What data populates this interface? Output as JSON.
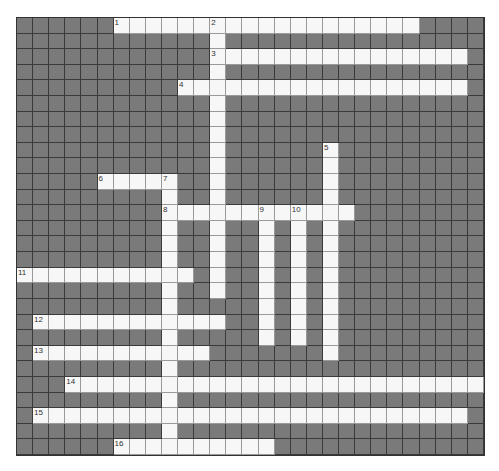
{
  "puzzle": {
    "cols": 29,
    "rows": 28,
    "colors": {
      "block": "#7a7a7a",
      "open": "#f7f7f7",
      "gridline": "#3a3a3a"
    },
    "across": [
      {
        "number": 1,
        "row": 0,
        "col": 6,
        "length": 19
      },
      {
        "number": 3,
        "row": 2,
        "col": 12,
        "length": 16
      },
      {
        "number": 4,
        "row": 4,
        "col": 10,
        "length": 18
      },
      {
        "number": 6,
        "row": 10,
        "col": 5,
        "length": 5
      },
      {
        "number": 8,
        "row": 12,
        "col": 9,
        "length": 12
      },
      {
        "number": 11,
        "row": 16,
        "col": 0,
        "length": 11
      },
      {
        "number": 12,
        "row": 19,
        "col": 1,
        "length": 12
      },
      {
        "number": 13,
        "row": 21,
        "col": 1,
        "length": 11
      },
      {
        "number": 14,
        "row": 23,
        "col": 3,
        "length": 26
      },
      {
        "number": 15,
        "row": 25,
        "col": 1,
        "length": 27
      },
      {
        "number": 16,
        "row": 27,
        "col": 6,
        "length": 10
      }
    ],
    "down": [
      {
        "number": 2,
        "row": 0,
        "col": 12,
        "length": 18
      },
      {
        "number": 5,
        "row": 8,
        "col": 19,
        "length": 14
      },
      {
        "number": 7,
        "row": 10,
        "col": 9,
        "length": 18
      },
      {
        "number": 9,
        "row": 12,
        "col": 15,
        "length": 9
      },
      {
        "number": 10,
        "row": 12,
        "col": 17,
        "length": 9
      }
    ]
  }
}
